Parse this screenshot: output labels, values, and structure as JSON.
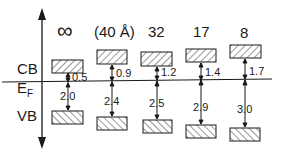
{
  "diagram": {
    "axis_labels": {
      "cb": "CB",
      "ef_main": "E",
      "ef_sub": "F",
      "vb": "VB"
    },
    "columns": [
      {
        "header": "∞",
        "cb_gap": "0.5",
        "vb_gap": "2.0"
      },
      {
        "header": "(40 Å)",
        "cb_gap": "0.9",
        "vb_gap": "2.4"
      },
      {
        "header": "32",
        "cb_gap": "1.2",
        "vb_gap": "2.5"
      },
      {
        "header": "17",
        "cb_gap": "1.4",
        "vb_gap": "2.9"
      },
      {
        "header": "8",
        "cb_gap": "1.7",
        "vb_gap": "3.0"
      }
    ],
    "colors": {
      "line": "#1a1a1a",
      "background": "#ffffff"
    }
  }
}
